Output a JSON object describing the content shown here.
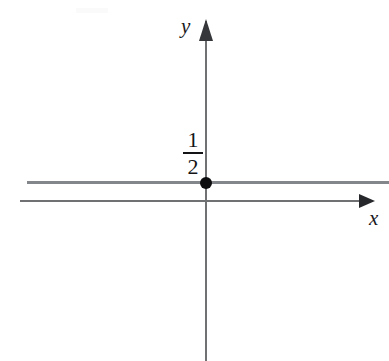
{
  "figure": {
    "type": "cartesian-plot",
    "background_color": "#ffffff"
  },
  "axes": {
    "x_axis": {
      "label": "x",
      "color": "#6f7173",
      "arrow_direction": "right"
    },
    "y_axis": {
      "label": "y",
      "color": "#6f7173",
      "arrow_direction": "up"
    },
    "origin": {
      "x": 206,
      "y": 201
    }
  },
  "chart_data": {
    "type": "line",
    "title": "",
    "xlabel": "x",
    "ylabel": "y",
    "grid": false,
    "legend": null,
    "series": [
      {
        "name": "y = 1/2",
        "kind": "horizontal-line",
        "constant_value": 0.5,
        "color": "#83868a",
        "x_extent": [
          -5.2,
          5.6
        ]
      }
    ],
    "points": [
      {
        "name": "y-intercept",
        "x": 0,
        "y": 0.5,
        "marker": "filled-circle",
        "color": "#0d0d0f",
        "label": "1/2"
      }
    ],
    "annotations": [
      {
        "name": "y-intercept-fraction",
        "text": "1/2",
        "numerator": "1",
        "denominator": "2",
        "position": "left of y-axis, above the line"
      }
    ]
  },
  "labels": {
    "y_intercept": {
      "numerator": "1",
      "denominator": "2"
    }
  }
}
